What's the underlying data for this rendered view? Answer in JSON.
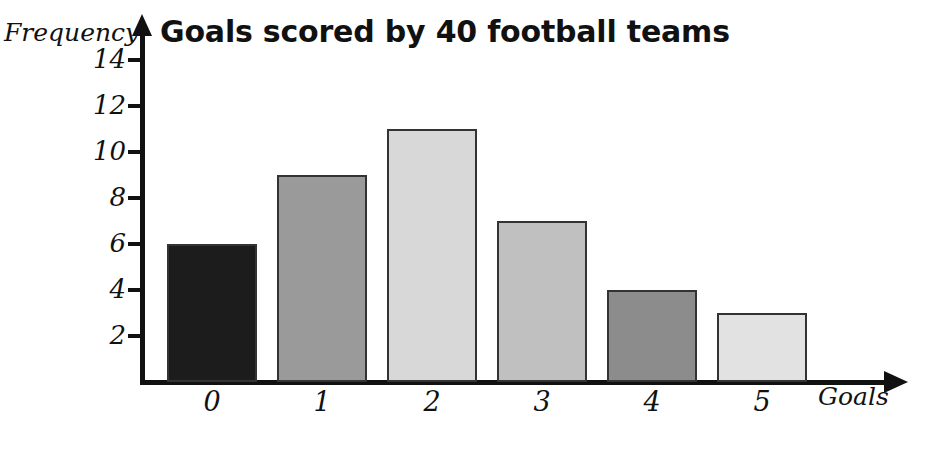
{
  "chart_data": {
    "type": "bar",
    "title": "Goals scored by 40 football teams",
    "xlabel": "Goals",
    "ylabel": "Frequency",
    "categories": [
      "0",
      "1",
      "2",
      "3",
      "4",
      "5"
    ],
    "values": [
      6,
      9,
      11,
      7,
      4,
      3
    ],
    "series": [
      {
        "name": "Frequency",
        "values": [
          6,
          9,
          11,
          7,
          4,
          3
        ]
      }
    ],
    "ylim": [
      0,
      15
    ],
    "xlim": [
      0,
      6
    ],
    "yticks": [
      2,
      4,
      6,
      8,
      10,
      12,
      14
    ],
    "ytick_labels": [
      "2",
      "4",
      "6",
      "8",
      "10",
      "12",
      "14"
    ],
    "grid": false,
    "legend": false,
    "legend_position": "none",
    "bar_colors": [
      "#1c1c1c",
      "#9a9a9a",
      "#d8d8d8",
      "#c0c0c0",
      "#8c8c8c",
      "#e2e2e2"
    ],
    "bar_edge_color": "#333333",
    "axis_color": "#111111",
    "background_color": "#ffffff",
    "total_frequency": 40
  }
}
